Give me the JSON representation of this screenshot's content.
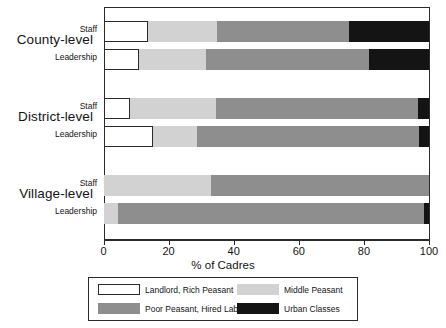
{
  "chart_data": {
    "type": "bar",
    "orientation": "horizontal",
    "stacked": true,
    "percent_stacked": true,
    "title": "",
    "xlabel": "% of Cadres",
    "ylabel": "",
    "xlim": [
      0,
      100
    ],
    "xticks": [
      0,
      20,
      40,
      60,
      80,
      100
    ],
    "xticklabels": [
      "0",
      "20",
      "40",
      "60",
      "80",
      "100"
    ],
    "grid": false,
    "legend_position": "bottom",
    "groups": [
      "County-level",
      "District-level",
      "Village-level"
    ],
    "categories": [
      "County-level Staff",
      "County-level Leadership",
      "District-level Staff",
      "District-level Leadership",
      "Village-level Staff",
      "Village-level Leadership"
    ],
    "series": [
      {
        "name": "Landlord, Rich Peasant",
        "color": "#ffffff",
        "values": [
          13.7,
          10.9,
          8.1,
          15.2,
          0.0,
          0.0
        ]
      },
      {
        "name": "Middle Peasant",
        "color": "#d2d2d2",
        "values": [
          21.2,
          20.6,
          26.5,
          13.5,
          33.0,
          4.5
        ]
      },
      {
        "name": "Poor Peasant, Hired Laborer",
        "color": "#8e8e8e",
        "values": [
          40.5,
          50.1,
          62.0,
          68.2,
          67.0,
          94.0
        ]
      },
      {
        "name": "Urban Classes",
        "color": "#141414",
        "values": [
          24.6,
          18.4,
          3.4,
          3.1,
          0.0,
          1.5
        ]
      }
    ]
  },
  "axis": {
    "x_title": "% of Cadres",
    "ticks": [
      "0",
      "20",
      "40",
      "60",
      "80",
      "100"
    ]
  },
  "groups": [
    {
      "label": "County-level",
      "rows": [
        {
          "label": "Staff",
          "segments": [
            13.7,
            21.2,
            40.5,
            24.6
          ]
        },
        {
          "label": "Leadership",
          "segments": [
            10.9,
            20.6,
            50.1,
            18.4
          ]
        }
      ]
    },
    {
      "label": "District-level",
      "rows": [
        {
          "label": "Staff",
          "segments": [
            8.1,
            26.5,
            62.0,
            3.4
          ]
        },
        {
          "label": "Leadership",
          "segments": [
            15.2,
            13.5,
            68.2,
            3.1
          ]
        }
      ]
    },
    {
      "label": "Village-level",
      "rows": [
        {
          "label": "Staff",
          "segments": [
            0.0,
            33.0,
            67.0,
            0.0
          ]
        },
        {
          "label": "Leadership",
          "segments": [
            0.0,
            4.5,
            94.0,
            1.5
          ]
        }
      ]
    }
  ],
  "legend": {
    "items": [
      {
        "label": "Landlord, Rich Peasant",
        "key": "landlord"
      },
      {
        "label": "Middle Peasant",
        "key": "middle"
      },
      {
        "label": "Poor Peasant, Hired Laborer",
        "key": "poor"
      },
      {
        "label": "Urban Classes",
        "key": "urban"
      }
    ]
  },
  "colors": {
    "landlord": "#ffffff",
    "middle": "#d2d2d2",
    "poor": "#8e8e8e",
    "urban": "#141414",
    "axis": "#2b2b2b",
    "text": "#141414"
  }
}
